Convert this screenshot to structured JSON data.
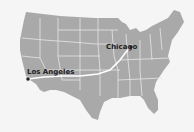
{
  "map": {
    "region": "Contiguous United States",
    "land_color": "#a9a9a9",
    "border_color": "#e6e6e6",
    "route_color": "#ffffff",
    "background_color": "#f5f5f5",
    "marker_color": "#222222"
  },
  "cities": [
    {
      "name": "Chicago",
      "label": "Chicago"
    },
    {
      "name": "Los Angeles",
      "label": "Los Angeles"
    }
  ],
  "route": {
    "from": "Los Angeles",
    "to": "Chicago"
  }
}
